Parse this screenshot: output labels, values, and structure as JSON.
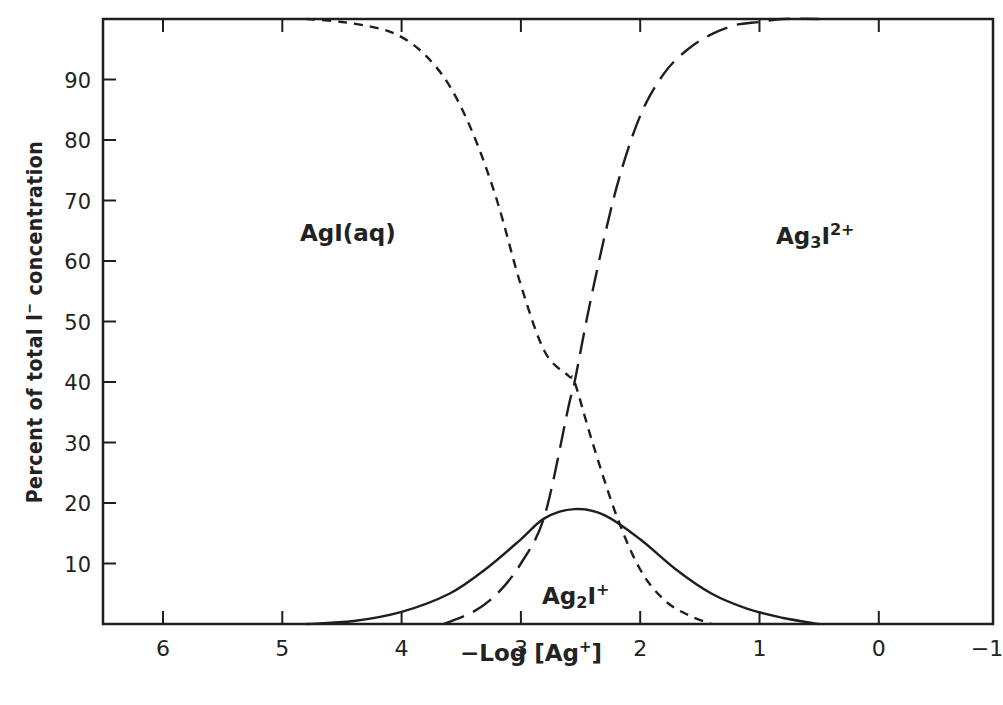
{
  "chart_data": {
    "type": "line",
    "title": "",
    "xlabel": "-Log [Ag+]",
    "ylabel": "Percent of total I- concentration",
    "xlim": [
      6.5,
      -1
    ],
    "ylim": [
      0,
      100
    ],
    "x_reversed": true,
    "grid": false,
    "x_ticks": [
      6,
      5,
      4,
      3,
      2,
      1,
      0,
      -1
    ],
    "x_tick_labels": [
      "6",
      "5",
      "4",
      "3",
      "2",
      "1",
      "0",
      "-1"
    ],
    "y_ticks": [
      10,
      20,
      30,
      40,
      50,
      60,
      70,
      80,
      90
    ],
    "y_tick_labels": [
      "10",
      "20",
      "30",
      "40",
      "50",
      "60",
      "70",
      "80",
      "90"
    ],
    "series": [
      {
        "name": "AgI(aq)",
        "style": "short-dash",
        "x": [
          4.8,
          4.5,
          4.2,
          4.0,
          3.8,
          3.6,
          3.4,
          3.2,
          3.0,
          2.8,
          2.6,
          2.55,
          2.4,
          2.2,
          2.0,
          1.8,
          1.6,
          1.4
        ],
        "values": [
          100,
          99.5,
          98.5,
          97,
          94,
          89,
          81,
          70,
          56,
          45,
          41,
          40,
          30,
          18,
          9,
          4,
          1.5,
          0
        ]
      },
      {
        "name": "Ag2I+",
        "style": "solid",
        "x": [
          4.8,
          4.4,
          4.0,
          3.6,
          3.3,
          3.0,
          2.8,
          2.55,
          2.3,
          2.0,
          1.7,
          1.4,
          1.1,
          0.8,
          0.5
        ],
        "values": [
          0,
          0.5,
          2,
          5,
          9,
          14,
          17.5,
          19,
          18,
          14,
          9,
          5,
          2.5,
          1,
          0
        ]
      },
      {
        "name": "Ag3I2+",
        "style": "long-dash",
        "x": [
          3.65,
          3.4,
          3.2,
          3.0,
          2.8,
          2.6,
          2.55,
          2.4,
          2.2,
          2.0,
          1.8,
          1.6,
          1.4,
          1.2,
          1.0,
          0.8,
          0.5
        ],
        "values": [
          0,
          2,
          5,
          10,
          18,
          36,
          40,
          55,
          72,
          84,
          91,
          95,
          97.5,
          99,
          99.5,
          100,
          100
        ]
      }
    ],
    "annotations": [
      {
        "text": "AgI(aq)",
        "x": 4.05,
        "y": 65
      },
      {
        "text": "Ag3I2+",
        "x": 0.6,
        "y": 65
      },
      {
        "text": "Ag2I+",
        "x": 2.6,
        "y": 5
      }
    ]
  },
  "labels": {
    "ylabel_main": "Percent of total I",
    "ylabel_sup": "−",
    "ylabel_tail": " concentration",
    "xlabel_main": "−Log [Ag",
    "xlabel_sup": "+",
    "xlabel_tail": "]",
    "agi_main": "AgI(aq)",
    "ag3_a": "Ag",
    "ag3_sub": "3",
    "ag3_b": "I",
    "ag3_sup": "2+",
    "ag2_a": "Ag",
    "ag2_sub": "2",
    "ag2_b": "I",
    "ag2_sup": "+"
  }
}
